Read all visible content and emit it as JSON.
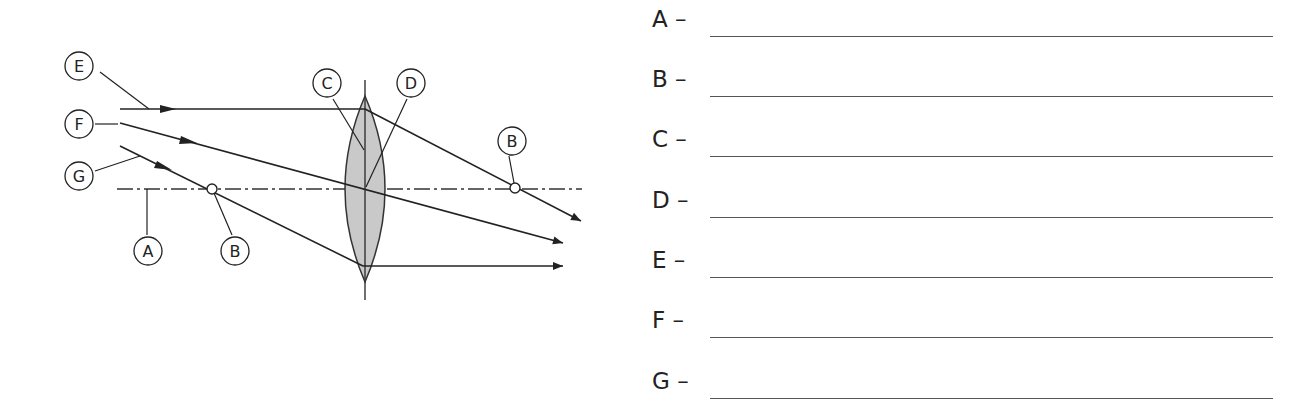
{
  "diagram": {
    "lens": {
      "type": "convex",
      "fill": "#c9c9c9",
      "stroke": "#333333"
    },
    "labels": [
      {
        "id": "E",
        "text": "E",
        "cx": 79,
        "cy": 66
      },
      {
        "id": "F",
        "text": "F",
        "cx": 79,
        "cy": 124
      },
      {
        "id": "G",
        "text": "G",
        "cx": 79,
        "cy": 176
      },
      {
        "id": "A",
        "text": "A",
        "cx": 148,
        "cy": 251
      },
      {
        "id": "B_left",
        "text": "B",
        "cx": 235,
        "cy": 251
      },
      {
        "id": "C",
        "text": "C",
        "cx": 327,
        "cy": 83
      },
      {
        "id": "D",
        "text": "D",
        "cx": 411,
        "cy": 83
      },
      {
        "id": "B_right",
        "text": "B",
        "cx": 512,
        "cy": 140
      }
    ]
  },
  "answers": {
    "rows": [
      {
        "letter": "A –",
        "value": ""
      },
      {
        "letter": "B –",
        "value": ""
      },
      {
        "letter": "C –",
        "value": ""
      },
      {
        "letter": "D –",
        "value": ""
      },
      {
        "letter": "E –",
        "value": ""
      },
      {
        "letter": "F –",
        "value": ""
      },
      {
        "letter": "G –",
        "value": ""
      }
    ]
  }
}
